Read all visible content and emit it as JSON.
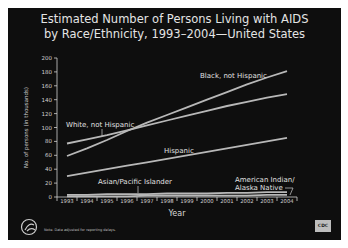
{
  "title_line1": "Estimated Number of Persons Living with AIDS",
  "title_line2": "by Race/Ethnicity, 1993–2004—United States",
  "footnote": "Note. Data adjusted for reporting delays.",
  "badge": "CDC",
  "chart_data": {
    "type": "line",
    "title": "Estimated Number of Persons Living with AIDS by Race/Ethnicity, 1993–2004—United States",
    "xlabel": "Year",
    "ylabel": "No. of persons (in thousands)",
    "ylim": [
      0,
      200
    ],
    "yticks": [
      0,
      20,
      40,
      60,
      80,
      100,
      120,
      140,
      160,
      180,
      200
    ],
    "categories": [
      "1993",
      "1994",
      "1995",
      "1996",
      "1997",
      "1998",
      "1999",
      "2000",
      "2001",
      "2002",
      "2003",
      "2004"
    ],
    "series": [
      {
        "name": "White, not Hispanic",
        "values": [
          77,
          83,
          89,
          96,
          103,
          110,
          117,
          124,
          131,
          137,
          143,
          148
        ]
      },
      {
        "name": "Black, not Hispanic",
        "values": [
          59,
          70,
          82,
          95,
          107,
          118,
          129,
          140,
          151,
          162,
          172,
          181
        ]
      },
      {
        "name": "Hispanic",
        "values": [
          30,
          35,
          40,
          45,
          50,
          55,
          60,
          65,
          70,
          75,
          80,
          85
        ]
      },
      {
        "name": "Asian/Pacific Islander",
        "values": [
          3,
          3,
          4,
          4,
          4,
          5,
          5,
          5,
          6,
          6,
          7,
          7
        ]
      },
      {
        "name": "American Indian/Alaska Native",
        "values": [
          1,
          1,
          1,
          1,
          2,
          2,
          2,
          2,
          2,
          2,
          3,
          3
        ]
      }
    ],
    "grid": false,
    "legend": "inline labels"
  }
}
